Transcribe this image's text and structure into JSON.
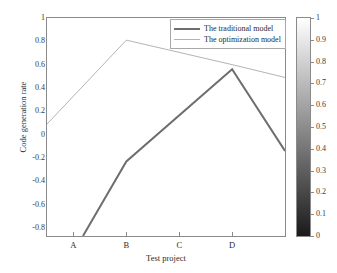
{
  "chart_data": {
    "type": "line",
    "title": "",
    "xlabel": "Test project",
    "ylabel": "Code generation rate",
    "categories": [
      "A",
      "B",
      "C",
      "D"
    ],
    "xlim": [
      0.5,
      5.0
    ],
    "ylim": [
      -0.87,
      1.0
    ],
    "grid": false,
    "legend_position": "top-right",
    "yticks": [
      "1",
      "0.8",
      "0.6",
      "0.4",
      "0.2",
      "0",
      "-0.2",
      "-0.4",
      "-0.6",
      "-0.8"
    ],
    "ytick_values": [
      1,
      0.8,
      0.6,
      0.4,
      0.2,
      0,
      -0.2,
      -0.4,
      -0.6,
      -0.8
    ],
    "xticks": [
      "A",
      "B",
      "C",
      "D"
    ],
    "xtick_values": [
      1,
      2,
      3,
      4
    ],
    "series": [
      {
        "name": "The traditional model",
        "color": "#6e6e6e",
        "width": 2,
        "x": [
          1.18,
          2,
          4,
          5
        ],
        "values": [
          -0.87,
          -0.23,
          0.56,
          -0.14
        ]
      },
      {
        "name": "The optimization model",
        "color": "#b4b4b4",
        "width": 1,
        "x": [
          0.5,
          2,
          4,
          5
        ],
        "values": [
          0.09,
          0.81,
          0.6,
          0.49
        ]
      }
    ],
    "colorbar": {
      "min": 0,
      "max": 1,
      "ticks": [
        "1",
        "0.9",
        "0.8",
        "0.7",
        "0.6",
        "0.5",
        "0.4",
        "0.3",
        "0.2",
        "0.1",
        "0"
      ],
      "tick_values": [
        1,
        0.9,
        0.8,
        0.7,
        0.6,
        0.5,
        0.4,
        0.3,
        0.2,
        0.1,
        0
      ],
      "top_color": "#ffffff",
      "bottom_color": "#1a1a1a"
    }
  },
  "legend": {
    "items": [
      {
        "label": "The traditional model"
      },
      {
        "label": "The optimization model"
      }
    ]
  }
}
